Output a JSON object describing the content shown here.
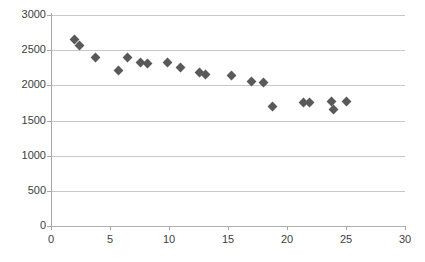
{
  "chart_data": {
    "type": "scatter",
    "title": "",
    "xlabel": "",
    "ylabel": "",
    "xlim": [
      0,
      30
    ],
    "ylim": [
      0,
      3000
    ],
    "xticks": [
      0,
      5,
      10,
      15,
      20,
      25,
      30
    ],
    "yticks": [
      0,
      500,
      1000,
      1500,
      2000,
      2500,
      3000
    ],
    "xtick_labels": [
      "0",
      "5",
      "10",
      "15",
      "20",
      "25",
      "30"
    ],
    "ytick_labels": [
      "0",
      "500",
      "1000",
      "1500",
      "2000",
      "2500",
      "3000"
    ],
    "grid": "horizontal",
    "legend": "none",
    "marker": "diamond",
    "marker_color": "#595959",
    "grid_color": "#c8c8c8",
    "axis_color": "#a6a6a6",
    "background": "#ffffff",
    "series": [
      {
        "name": "series-1",
        "points": [
          [
            2.0,
            2650
          ],
          [
            2.4,
            2560
          ],
          [
            3.8,
            2390
          ],
          [
            5.7,
            2205
          ],
          [
            6.5,
            2400
          ],
          [
            7.6,
            2330
          ],
          [
            8.2,
            2310
          ],
          [
            9.9,
            2325
          ],
          [
            11.0,
            2255
          ],
          [
            12.6,
            2180
          ],
          [
            13.1,
            2160
          ],
          [
            15.3,
            2140
          ],
          [
            17.0,
            2050
          ],
          [
            18.0,
            2045
          ],
          [
            18.8,
            1700
          ],
          [
            21.4,
            1760
          ],
          [
            21.9,
            1755
          ],
          [
            23.8,
            1775
          ],
          [
            23.9,
            1660
          ],
          [
            25.0,
            1765
          ]
        ]
      }
    ]
  }
}
